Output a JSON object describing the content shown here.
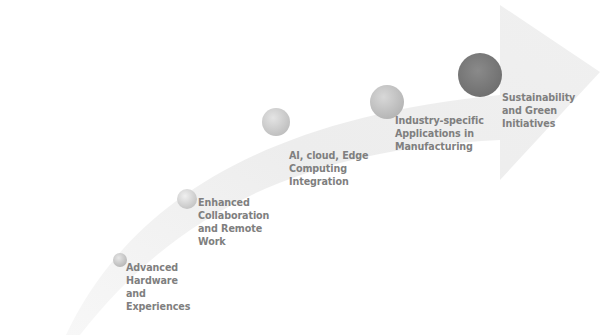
{
  "diagram": {
    "type": "curved-arrow-roadmap",
    "colors": {
      "arrow_fill": "#ececec",
      "label_text": "#7f7f7f",
      "circle_light": "#d9d9d9",
      "circle_dark": "#7a7a7a"
    },
    "steps": [
      {
        "id": "step-1",
        "lines": [
          "Advanced",
          "Hardware",
          "and",
          "Experiences"
        ],
        "circle_color": "#c8c8c8"
      },
      {
        "id": "step-2",
        "lines": [
          "Enhanced",
          "Collaboration",
          "and Remote",
          "Work"
        ],
        "circle_color": "#d4d4d4"
      },
      {
        "id": "step-3",
        "lines": [
          "AI, cloud, Edge",
          "Computing",
          "Integration"
        ],
        "circle_color": "#cdcdcd"
      },
      {
        "id": "step-4",
        "lines": [
          "Industry-specific",
          "Applications in",
          "Manufacturing"
        ],
        "circle_color": "#c4c4c4"
      },
      {
        "id": "step-5",
        "lines": [
          "Sustainability",
          "and Green",
          "Initiatives"
        ],
        "circle_color": "#7d7d7d"
      }
    ]
  }
}
